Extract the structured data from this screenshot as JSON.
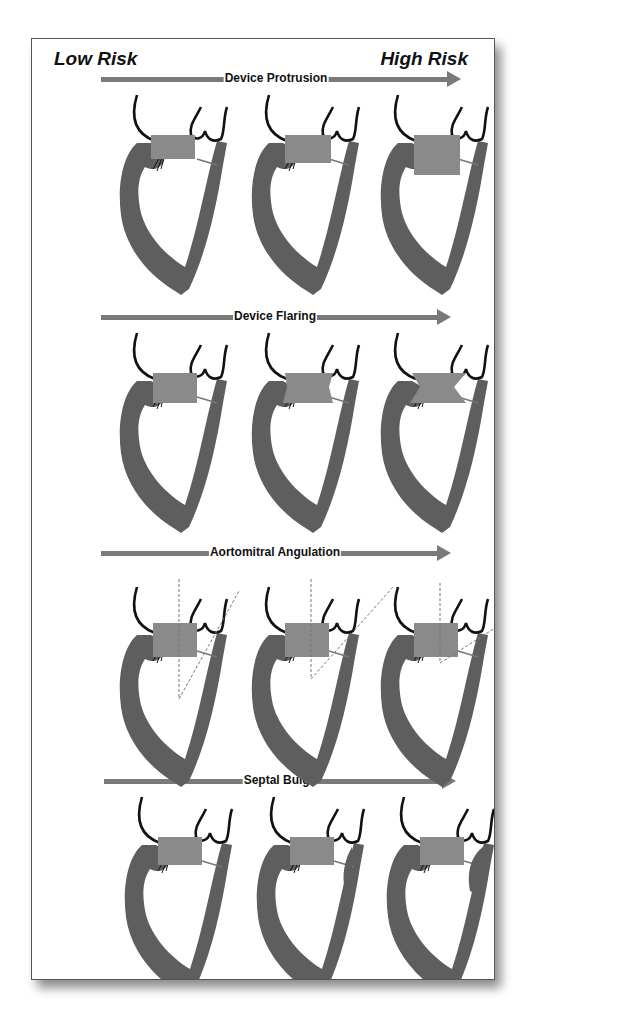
{
  "figure": {
    "low_risk_label": "Low Risk",
    "high_risk_label": "High Risk",
    "colors": {
      "myocardium": "#5e5e5e",
      "device": "#8a8a8a",
      "arrow": "#7a7a7a",
      "leaflet_line": "#111111",
      "frame_border": "#555555"
    },
    "panels": [
      {
        "title": "Device Protrusion",
        "hearts": [
          {
            "stage": "low",
            "description": "small device protrusion into LVOT"
          },
          {
            "stage": "medium",
            "description": "moderate device protrusion"
          },
          {
            "stage": "high",
            "description": "large device protrusion"
          }
        ]
      },
      {
        "title": "Device Flaring",
        "hearts": [
          {
            "stage": "low",
            "description": "no flaring"
          },
          {
            "stage": "medium",
            "description": "mild flaring"
          },
          {
            "stage": "high",
            "description": "marked flaring"
          }
        ]
      },
      {
        "title": "Aortomitral Angulation",
        "hearts": [
          {
            "stage": "low",
            "description": "obtuse aortomitral angle"
          },
          {
            "stage": "medium",
            "description": "intermediate angle"
          },
          {
            "stage": "high",
            "description": "acute aortomitral angle"
          }
        ]
      },
      {
        "title": "Septal Bulge",
        "hearts": [
          {
            "stage": "low",
            "description": "no septal bulge"
          },
          {
            "stage": "medium",
            "description": "mild septal bulge"
          },
          {
            "stage": "high",
            "description": "prominent septal bulge"
          }
        ]
      }
    ]
  }
}
